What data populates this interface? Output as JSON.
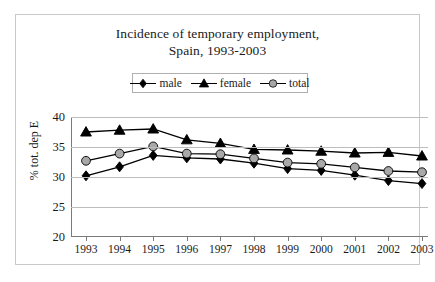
{
  "title": {
    "line1": "Incidence of temporary employment,",
    "line2": "Spain, 1993-2003"
  },
  "legend": {
    "items": [
      {
        "label": "male",
        "marker": "diamond",
        "color": "#000000"
      },
      {
        "label": "female",
        "marker": "triangle",
        "color": "#000000"
      },
      {
        "label": "total",
        "marker": "circle",
        "color": "#a8a8a8"
      }
    ]
  },
  "axes": {
    "ylabel": "% tot. dep E",
    "yticks": [
      40,
      35,
      30,
      25,
      20
    ],
    "xlabel": ""
  },
  "chart_data": {
    "type": "line",
    "title": "Incidence of temporary employment, Spain, 1993-2003",
    "xlabel": "",
    "ylabel": "% tot. dep E",
    "x": [
      1993,
      1994,
      1995,
      1996,
      1997,
      1998,
      1999,
      2000,
      2001,
      2002,
      2003
    ],
    "categories": [
      "1993",
      "1994",
      "1995",
      "1996",
      "1997",
      "1998",
      "1999",
      "2000",
      "2001",
      "2002",
      "2003"
    ],
    "series": [
      {
        "name": "male",
        "marker": "diamond",
        "color": "#000000",
        "values": [
          30.2,
          31.7,
          33.6,
          33.2,
          33.0,
          32.3,
          31.4,
          31.1,
          30.3,
          29.4,
          28.9
        ]
      },
      {
        "name": "female",
        "marker": "triangle",
        "color": "#000000",
        "values": [
          37.5,
          37.8,
          38.0,
          36.2,
          35.6,
          34.6,
          34.5,
          34.3,
          34.0,
          34.1,
          33.5
        ]
      },
      {
        "name": "total",
        "marker": "circle",
        "color": "#a8a8a8",
        "values": [
          32.7,
          33.9,
          35.1,
          33.9,
          33.8,
          33.1,
          32.4,
          32.2,
          31.6,
          31.0,
          30.8
        ]
      }
    ],
    "ylim": [
      20,
      40
    ],
    "ytick_step": 5,
    "grid": true,
    "legend_position": "top-center"
  }
}
